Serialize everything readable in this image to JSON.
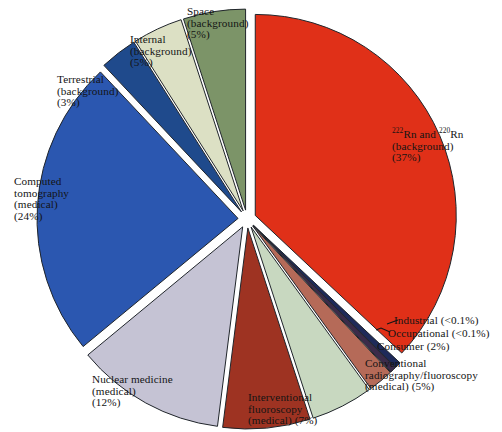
{
  "chart_data": {
    "type": "pie",
    "title": "",
    "subtitle": "",
    "xlabel": "",
    "ylabel": "",
    "legend_position": "none",
    "grid": false,
    "exploded": true,
    "units": "percent of total effective dose",
    "categories": [
      "Space (background)",
      "²²²Rn and ²²⁰Rn (background)",
      "Industrial",
      "Occupational",
      "Consumer",
      "Conventional radiography/fluoroscopy (medical)",
      "Interventional fluoroscopy (medical)",
      "Nuclear medicine (medical)",
      "Computed tomography (medical)",
      "Terrestrial (background)",
      "Internal (background)"
    ],
    "values": [
      5,
      37,
      0.05,
      0.05,
      2,
      5,
      7,
      12,
      24,
      3,
      5
    ],
    "value_labels": [
      "5%",
      "37%",
      "<0.1%",
      "<0.1%",
      "2%",
      "5%",
      "7%",
      "12%",
      "3%",
      "24%",
      "5%"
    ],
    "colors": [
      "#7C9468",
      "#E03018",
      "#1E2A5A",
      "#3B2B4A",
      "#B56A58",
      "#C8D8C0",
      "#9E3322",
      "#C5C3D4",
      "#2B57B0",
      "#1F4A8C",
      "#DCE0C4"
    ],
    "slices": [
      {
        "name": "space",
        "label": "Space (background) (5%)",
        "value": 5,
        "percent_text": "5%",
        "color": "#7C9468",
        "start_deg": -18.0,
        "end_deg": 0.0
      },
      {
        "name": "radon",
        "label": "222Rn and 220Rn (background) (37%)",
        "value": 37,
        "percent_text": "37%",
        "color": "#E03018",
        "start_deg": 0.0,
        "end_deg": 133.2
      },
      {
        "name": "industrial",
        "label": "Industrial (<0.1%)",
        "value": 0.05,
        "percent_text": "<0.1%",
        "color": "#1E2A5A",
        "start_deg": 133.2,
        "end_deg": 135.0
      },
      {
        "name": "occupational",
        "label": "Occupational (<0.1%)",
        "value": 0.05,
        "percent_text": "<0.1%",
        "color": "#3B2B4A",
        "start_deg": 135.0,
        "end_deg": 136.8
      },
      {
        "name": "consumer",
        "label": "Consumer (2%)",
        "value": 2,
        "percent_text": "2%",
        "color": "#B56A58",
        "start_deg": 136.8,
        "end_deg": 144.0
      },
      {
        "name": "conventional-radiography",
        "label": "Conventional radiography/fluoroscopy (medical) (5%)",
        "value": 5,
        "percent_text": "5%",
        "color": "#C8D8C0",
        "start_deg": 144.0,
        "end_deg": 162.0
      },
      {
        "name": "interventional-fluoroscopy",
        "label": "Interventional fluoroscopy (medical) (7%)",
        "value": 7,
        "percent_text": "7%",
        "color": "#9E3322",
        "start_deg": 162.0,
        "end_deg": 187.2
      },
      {
        "name": "nuclear-medicine",
        "label": "Nuclear medicine (medical) (12%)",
        "value": 12,
        "percent_text": "12%",
        "color": "#C5C3D4",
        "start_deg": 187.2,
        "end_deg": 230.4
      },
      {
        "name": "computed-tomography",
        "label": "Computed tomography (medical) (24%)",
        "value": 24,
        "percent_text": "24%",
        "color": "#2B57B0",
        "start_deg": 230.4,
        "end_deg": 316.8
      },
      {
        "name": "terrestrial",
        "label": "Terrestrial (background) (3%)",
        "value": 3,
        "percent_text": "3%",
        "color": "#1F4A8C",
        "start_deg": 316.8,
        "end_deg": 327.6
      },
      {
        "name": "internal",
        "label": "Internal (background) (5%)",
        "value": 5,
        "percent_text": "5%",
        "color": "#DCE0C4",
        "start_deg": 327.6,
        "end_deg": 342.0
      }
    ]
  },
  "labels": {
    "space": {
      "l1": "Space",
      "l2": "(background)",
      "l3": "(5%)"
    },
    "internal": {
      "l1": "Internal",
      "l2": "(background)",
      "l3": "(5%)"
    },
    "terrestrial": {
      "l1": "Terrestrial",
      "l2": "(background)",
      "l3": "(3%)"
    },
    "computed_tomography": {
      "l1": "Computed",
      "l2": "tomography",
      "l3": "(medical)",
      "l4": "(24%)"
    },
    "nuclear_medicine": {
      "l1": "Nuclear medicine",
      "l2": "(medical)",
      "l3": "(12%)"
    },
    "interventional": {
      "l1": "Interventional",
      "l2": "fluoroscopy",
      "l3": "(medical) (7%)"
    },
    "conventional": {
      "l1": "Conventional",
      "l2": "radiography/fluoroscopy",
      "l3": "(medical) (5%)"
    },
    "consumer": {
      "l1": "Consumer (2%)"
    },
    "occupational": {
      "l1": "Occupational (<0.1%)"
    },
    "industrial": {
      "l1": "Industrial (<0.1%)"
    },
    "radon": {
      "sup1": "222",
      "mid": "Rn and ",
      "sup2": "220",
      "tail": "Rn",
      "l2": "(background)",
      "l3": "(37%)"
    }
  }
}
